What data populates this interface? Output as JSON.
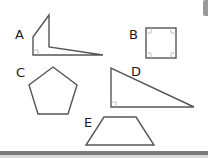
{
  "diagram": {
    "stroke_color": "#555555",
    "marker_color": "#9a9a9a",
    "shapes": [
      {
        "id": "A",
        "label": "A",
        "kind": "irregular-polygon",
        "right_angle_markers": 1
      },
      {
        "id": "B",
        "label": "B",
        "kind": "square",
        "right_angle_markers": 4
      },
      {
        "id": "C",
        "label": "C",
        "kind": "regular-pentagon",
        "right_angle_markers": 0
      },
      {
        "id": "D",
        "label": "D",
        "kind": "right-triangle",
        "right_angle_markers": 1
      },
      {
        "id": "E",
        "label": "E",
        "kind": "trapezoid",
        "right_angle_markers": 0
      }
    ]
  }
}
